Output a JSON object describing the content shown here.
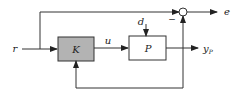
{
  "diagram": {
    "type": "block-diagram",
    "blocks": [
      {
        "id": "K",
        "label": "K",
        "fill": "#b3b3b3"
      },
      {
        "id": "P",
        "label": "P",
        "fill": "#ffffff"
      }
    ],
    "signals": {
      "reference": "r",
      "control": "u",
      "disturbance": "d",
      "output": "y",
      "output_sub": "P",
      "error": "e"
    },
    "summing_junction": {
      "sign_bottom": "−"
    },
    "colors": {
      "line": "#333333",
      "k_fill": "#b3b3b3"
    }
  }
}
